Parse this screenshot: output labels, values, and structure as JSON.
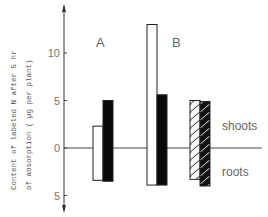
{
  "chart_data": {
    "type": "bar",
    "title": "",
    "xlabel": "",
    "ylabel": "Content of labeled N after 5 hr of absorption ( µg per plant)",
    "ylabel_lines": [
      "Content of labeled N after 5 hr",
      "of absorption ( µg per plant)"
    ],
    "yticks": [
      {
        "label": "10",
        "value": 10
      },
      {
        "label": "5",
        "value": 5
      },
      {
        "label": "0",
        "value": 0
      },
      {
        "label": "5",
        "value": -5
      }
    ],
    "ylim": [
      -5.5,
      14
    ],
    "grid": false,
    "region_labels": {
      "upper": "shoots",
      "lower": "roots"
    },
    "groups": [
      {
        "name": "A",
        "bars": [
          {
            "style": "white",
            "shoots": 2.3,
            "roots": 3.4
          },
          {
            "style": "black",
            "shoots": 5.0,
            "roots": 3.5
          }
        ]
      },
      {
        "name": "B",
        "bars": [
          {
            "style": "white",
            "shoots": 13.0,
            "roots": 3.9
          },
          {
            "style": "black",
            "shoots": 5.6,
            "roots": 3.9
          }
        ]
      },
      {
        "name": "",
        "bars": [
          {
            "style": "hatched-light",
            "shoots": 5.0,
            "roots": 3.3
          },
          {
            "style": "hatched-dark",
            "shoots": 4.9,
            "roots": 4.0
          }
        ]
      }
    ]
  }
}
